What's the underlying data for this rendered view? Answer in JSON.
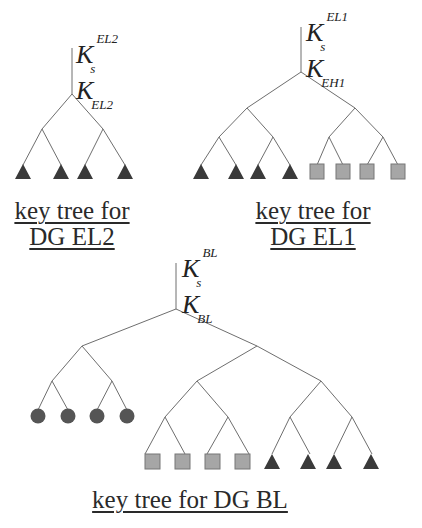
{
  "trees": [
    {
      "id": "el2",
      "caption_line1": "key tree for",
      "caption_line2": "DG EL2",
      "session_key": {
        "base": "K",
        "sub": "s",
        "sup": "EL2"
      },
      "group_key": {
        "base": "K",
        "sub": "EL2"
      },
      "leaves": {
        "shape": "triangle",
        "count": 4,
        "color": "#3a3a3a"
      }
    },
    {
      "id": "el1",
      "caption_line1": "key tree for",
      "caption_line2": "DG EL1",
      "session_key": {
        "base": "K",
        "sub": "s",
        "sup": "EL1"
      },
      "group_key": {
        "base": "K",
        "sub": "EH1"
      },
      "leaves": [
        {
          "shape": "triangle",
          "count": 4,
          "color": "#3a3a3a"
        },
        {
          "shape": "square",
          "count": 4,
          "color": "#a6a6a6"
        }
      ]
    },
    {
      "id": "bl",
      "caption": "key tree for DG BL",
      "session_key": {
        "base": "K",
        "sub": "s",
        "sup": "BL"
      },
      "group_key": {
        "base": "K",
        "sub": "BL"
      },
      "leaves": [
        {
          "shape": "circle",
          "count": 4,
          "color": "#555555"
        },
        {
          "shape": "square",
          "count": 4,
          "color": "#a6a6a6"
        },
        {
          "shape": "triangle",
          "count": 4,
          "color": "#3a3a3a"
        }
      ]
    }
  ],
  "colors": {
    "edge": "#6e6e6e",
    "triangle": "#3a3a3a",
    "square": "#a6a6a6",
    "square_border": "#777777",
    "circle": "#555555"
  }
}
